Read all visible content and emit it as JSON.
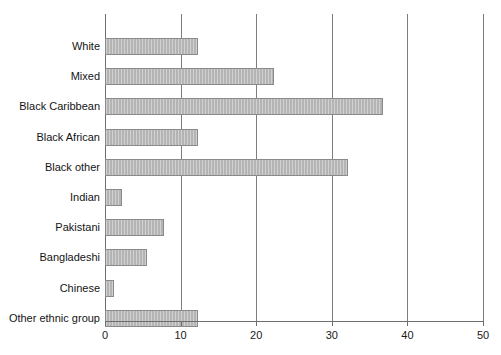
{
  "chart_data": {
    "type": "bar",
    "orientation": "horizontal",
    "title": "",
    "subtitle": "",
    "xlabel": "",
    "ylabel": "",
    "xlim": [
      0,
      50
    ],
    "xticks": [
      0,
      10,
      20,
      30,
      40,
      50
    ],
    "xtick_labels": [
      "0",
      "10",
      "20",
      "30",
      "40",
      "50"
    ],
    "grid": "vertical",
    "legend": "none",
    "bar_color": "#b4b4b4",
    "bar_edge_color": "#8a8a8a",
    "axis_color": "#6e6e6e",
    "categories": [
      "White",
      "Mixed",
      "Black Caribbean",
      "Black African",
      "Black other",
      "Indian",
      "Pakistani",
      "Bangladeshi",
      "Chinese",
      "Other ethnic group"
    ],
    "values": [
      12.3,
      22.4,
      36.8,
      12.3,
      32.1,
      2.2,
      7.8,
      5.6,
      1.2,
      12.3
    ],
    "bars": [
      {
        "label": "White",
        "value": 12.3
      },
      {
        "label": "Mixed",
        "value": 22.4
      },
      {
        "label": "Black Caribbean",
        "value": 36.8
      },
      {
        "label": "Black African",
        "value": 12.3
      },
      {
        "label": "Black other",
        "value": 32.1
      },
      {
        "label": "Indian",
        "value": 2.2
      },
      {
        "label": "Pakistani",
        "value": 7.8
      },
      {
        "label": "Bangladeshi",
        "value": 5.6
      },
      {
        "label": "Chinese",
        "value": 1.2
      },
      {
        "label": "Other ethnic group",
        "value": 12.3
      }
    ]
  }
}
